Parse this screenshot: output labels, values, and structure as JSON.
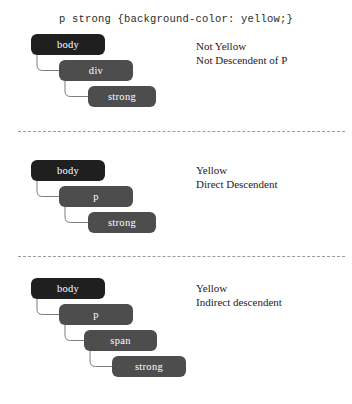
{
  "header": {
    "css_rule": "p strong {background-color: yellow;}"
  },
  "colors": {
    "page_background": "#ffffff",
    "root_node": "#1f1f1f",
    "node": "#4d4d4d",
    "node_text": "#ffffff",
    "connector": "#7d7d7d",
    "separator": "#9b9b9b",
    "annotation_text": "#1c1c1c"
  },
  "blocks": [
    {
      "id": "block-1",
      "nodes": [
        {
          "label": "body",
          "level": 0,
          "root": true
        },
        {
          "label": "div",
          "level": 1,
          "root": false
        },
        {
          "label": "strong",
          "level": 2,
          "root": false
        }
      ],
      "annotation": {
        "line1": "Not Yellow",
        "line2": "Not Descendent of P"
      }
    },
    {
      "id": "block-2",
      "nodes": [
        {
          "label": "body",
          "level": 0,
          "root": true
        },
        {
          "label": "p",
          "level": 1,
          "root": false
        },
        {
          "label": "strong",
          "level": 2,
          "root": false
        }
      ],
      "annotation": {
        "line1": "Yellow",
        "line2": "Direct Descendent"
      }
    },
    {
      "id": "block-3",
      "nodes": [
        {
          "label": "body",
          "level": 0,
          "root": true
        },
        {
          "label": "p",
          "level": 1,
          "root": false
        },
        {
          "label": "span",
          "level": 2,
          "root": false
        },
        {
          "label": "strong",
          "level": 3,
          "root": false
        }
      ],
      "annotation": {
        "line1": "Yellow",
        "line2": "Indirect descendent"
      }
    }
  ]
}
